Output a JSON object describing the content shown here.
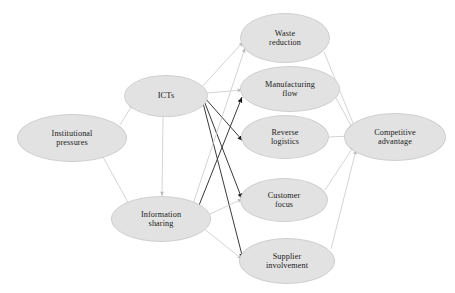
{
  "diagram": {
    "type": "conceptual-model-path-diagram",
    "background_color": "#ffffff",
    "node_fill_color": "#e2e2e2",
    "node_border_color": "#cfcfcf",
    "light_edge_color": "#c9c9c9",
    "dark_edge_color": "#3a3a3a",
    "nodes": [
      {
        "id": "institutional-pressures",
        "label": "Institutional\npressures",
        "cx": 72,
        "cy": 138,
        "rx": 55,
        "ry": 24,
        "font_size": 8.2
      },
      {
        "id": "icts",
        "label": "ICTs",
        "cx": 166,
        "cy": 96,
        "rx": 42,
        "ry": 21,
        "font_size": 8.4
      },
      {
        "id": "information-sharing",
        "label": "Information\nsharing",
        "cx": 161,
        "cy": 219,
        "rx": 50,
        "ry": 23,
        "font_size": 8.2
      },
      {
        "id": "waste-reduction",
        "label": "Waste\nreduction",
        "cx": 285,
        "cy": 38,
        "rx": 45,
        "ry": 25,
        "font_size": 8.2
      },
      {
        "id": "manufacturing-flow",
        "label": "Manufacturing\nflow",
        "cx": 290,
        "cy": 89,
        "rx": 50,
        "ry": 23,
        "font_size": 8.2
      },
      {
        "id": "reverse-logistics",
        "label": "Reverse\nlogistics",
        "cx": 285,
        "cy": 137,
        "rx": 44,
        "ry": 22,
        "font_size": 8.2
      },
      {
        "id": "customer-focus",
        "label": "Customer\nfocus",
        "cx": 284,
        "cy": 200,
        "rx": 44,
        "ry": 22,
        "font_size": 8.2
      },
      {
        "id": "supplier-involvement",
        "label": "Supplier\ninvolvement",
        "cx": 287,
        "cy": 261,
        "rx": 48,
        "ry": 23,
        "font_size": 8.2
      },
      {
        "id": "competitive-advantage",
        "label": "Competitive\nadvantage",
        "cx": 395,
        "cy": 137,
        "rx": 51,
        "ry": 24,
        "font_size": 8.2
      }
    ],
    "edges": [
      {
        "id": "institutional-pressures-to-icts",
        "from": "institutional-pressures",
        "to": "icts",
        "style": "light",
        "x1": 120,
        "y1": 125,
        "x2": 133,
        "y2": 104
      },
      {
        "id": "institutional-pressures-to-information-sharing",
        "from": "institutional-pressures",
        "to": "information-sharing",
        "style": "light",
        "x1": 103,
        "y1": 157,
        "x2": 130,
        "y2": 206
      },
      {
        "id": "icts-to-information-sharing",
        "from": "icts",
        "to": "information-sharing",
        "style": "light",
        "x1": 163,
        "y1": 117,
        "x2": 162,
        "y2": 196
      },
      {
        "id": "icts-to-waste-reduction",
        "from": "icts",
        "to": "waste-reduction",
        "style": "light",
        "x1": 201,
        "y1": 88,
        "x2": 243,
        "y2": 42
      },
      {
        "id": "icts-to-manufacturing-flow",
        "from": "icts",
        "to": "manufacturing-flow",
        "style": "light",
        "x1": 207,
        "y1": 93,
        "x2": 242,
        "y2": 90
      },
      {
        "id": "icts-to-reverse-logistics",
        "from": "icts",
        "to": "reverse-logistics",
        "style": "dark",
        "x1": 204,
        "y1": 97,
        "x2": 243,
        "y2": 141
      },
      {
        "id": "icts-to-customer-focus",
        "from": "icts",
        "to": "customer-focus",
        "style": "dark",
        "x1": 203,
        "y1": 98,
        "x2": 242,
        "y2": 199
      },
      {
        "id": "icts-to-supplier-involvement",
        "from": "icts",
        "to": "supplier-involvement",
        "style": "dark",
        "x1": 202,
        "y1": 99,
        "x2": 243,
        "y2": 259
      },
      {
        "id": "information-sharing-to-waste-reduction",
        "from": "information-sharing",
        "to": "waste-reduction",
        "style": "light",
        "x1": 192,
        "y1": 207,
        "x2": 245,
        "y2": 48
      },
      {
        "id": "information-sharing-to-manufacturing-flow",
        "from": "information-sharing",
        "to": "manufacturing-flow",
        "style": "dark",
        "x1": 196,
        "y1": 213,
        "x2": 242,
        "y2": 97
      },
      {
        "id": "information-sharing-to-customer-focus",
        "from": "information-sharing",
        "to": "customer-focus",
        "style": "light",
        "x1": 206,
        "y1": 216,
        "x2": 242,
        "y2": 199
      },
      {
        "id": "information-sharing-to-supplier-involvement",
        "from": "information-sharing",
        "to": "supplier-involvement",
        "style": "light",
        "x1": 203,
        "y1": 228,
        "x2": 242,
        "y2": 259
      },
      {
        "id": "waste-reduction-to-competitive-advantage",
        "from": "waste-reduction",
        "to": "competitive-advantage",
        "style": "light",
        "x1": 324,
        "y1": 52,
        "x2": 355,
        "y2": 128
      },
      {
        "id": "manufacturing-flow-to-competitive-advantage",
        "from": "manufacturing-flow",
        "to": "competitive-advantage",
        "style": "light",
        "x1": 336,
        "y1": 98,
        "x2": 354,
        "y2": 131
      },
      {
        "id": "reverse-logistics-to-competitive-advantage",
        "from": "reverse-logistics",
        "to": "competitive-advantage",
        "style": "light",
        "x1": 329,
        "y1": 137,
        "x2": 351,
        "y2": 136
      },
      {
        "id": "customer-focus-to-competitive-advantage",
        "from": "customer-focus",
        "to": "competitive-advantage",
        "style": "light",
        "x1": 325,
        "y1": 190,
        "x2": 354,
        "y2": 146
      },
      {
        "id": "supplier-involvement-to-competitive-advantage",
        "from": "supplier-involvement",
        "to": "competitive-advantage",
        "style": "light",
        "x1": 331,
        "y1": 249,
        "x2": 356,
        "y2": 150
      }
    ]
  }
}
